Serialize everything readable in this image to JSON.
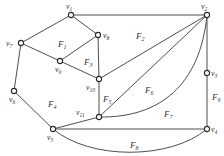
{
  "diagram": {
    "type": "planar-graph",
    "vertices": [
      {
        "id": "v1",
        "label": "v",
        "sub": "1",
        "x": 71,
        "y": 15,
        "lx": 66,
        "ly": 9
      },
      {
        "id": "v2",
        "label": "v",
        "sub": "2",
        "x": 207,
        "y": 15,
        "lx": 201,
        "ly": 9
      },
      {
        "id": "v3",
        "label": "v",
        "sub": "3",
        "x": 207,
        "y": 73,
        "lx": 211,
        "ly": 76
      },
      {
        "id": "v4",
        "label": "v",
        "sub": "4",
        "x": 207,
        "y": 129,
        "lx": 211,
        "ly": 132
      },
      {
        "id": "v5",
        "label": "v",
        "sub": "5",
        "x": 53,
        "y": 129,
        "lx": 47,
        "ly": 140
      },
      {
        "id": "v6",
        "label": "v",
        "sub": "6",
        "x": 14,
        "y": 91,
        "lx": 9,
        "ly": 102
      },
      {
        "id": "v7",
        "label": "v",
        "sub": "7",
        "x": 21,
        "y": 43,
        "lx": 6,
        "ly": 46
      },
      {
        "id": "v8",
        "label": "v",
        "sub": "8",
        "x": 98,
        "y": 35,
        "lx": 103,
        "ly": 38
      },
      {
        "id": "v9",
        "label": "v",
        "sub": "9",
        "x": 60,
        "y": 61,
        "lx": 55,
        "ly": 72
      },
      {
        "id": "v10",
        "label": "v",
        "sub": "10",
        "x": 99,
        "y": 79,
        "lx": 86,
        "ly": 90
      },
      {
        "id": "v11",
        "label": "v",
        "sub": "11",
        "x": 99,
        "y": 117,
        "lx": 76,
        "ly": 115
      }
    ],
    "edges": [
      {
        "from": "v1",
        "to": "v2"
      },
      {
        "from": "v1",
        "to": "v7"
      },
      {
        "from": "v1",
        "to": "v8"
      },
      {
        "from": "v7",
        "to": "v9"
      },
      {
        "from": "v7",
        "to": "v6"
      },
      {
        "from": "v6",
        "to": "v5"
      },
      {
        "from": "v9",
        "to": "v8"
      },
      {
        "from": "v9",
        "to": "v10"
      },
      {
        "from": "v8",
        "to": "v10"
      },
      {
        "from": "v10",
        "to": "v11"
      },
      {
        "from": "v10",
        "to": "v2"
      },
      {
        "from": "v11",
        "to": "v2"
      },
      {
        "from": "v11",
        "to": "v2",
        "curved": true
      },
      {
        "from": "v5",
        "to": "v11"
      },
      {
        "from": "v5",
        "to": "v4"
      },
      {
        "from": "v5",
        "to": "v4",
        "curved": true
      },
      {
        "from": "v2",
        "to": "v3"
      },
      {
        "from": "v3",
        "to": "v4"
      }
    ],
    "faces": [
      {
        "id": "F1",
        "label": "F",
        "sub": "1",
        "x": 58,
        "y": 45
      },
      {
        "id": "F2",
        "label": "F",
        "sub": "2",
        "x": 137,
        "y": 37
      },
      {
        "id": "F3",
        "label": "F",
        "sub": "3",
        "x": 85,
        "y": 63
      },
      {
        "id": "F4",
        "label": "F",
        "sub": "4",
        "x": 49,
        "y": 105
      },
      {
        "id": "F5",
        "label": "F",
        "sub": "5",
        "x": 104,
        "y": 100
      },
      {
        "id": "F6",
        "label": "F",
        "sub": "6",
        "x": 145,
        "y": 94
      },
      {
        "id": "F7",
        "label": "F",
        "sub": "7",
        "x": 164,
        "y": 116
      },
      {
        "id": "F8",
        "label": "F",
        "sub": "8",
        "x": 132,
        "y": 148
      },
      {
        "id": "F9",
        "label": "F",
        "sub": "9",
        "x": 214,
        "y": 100
      }
    ]
  }
}
